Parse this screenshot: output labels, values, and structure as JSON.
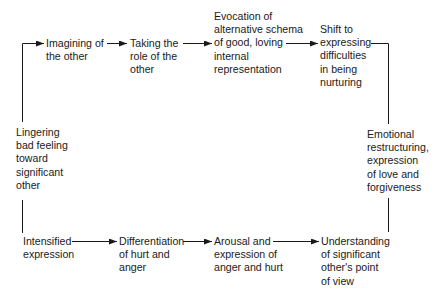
{
  "diagram": {
    "type": "cycle-flow",
    "nodes": [
      {
        "id": "lingering",
        "label": "Lingering\nbad feeling\ntoward\nsignificant\nother"
      },
      {
        "id": "imagining",
        "label": "Imagining of\nthe other"
      },
      {
        "id": "taking-role",
        "label": "Taking the\nrole of the\nother"
      },
      {
        "id": "evocation",
        "label": "Evocation of\nalternative schema\nof good, loving\ninternal\nrepresentation"
      },
      {
        "id": "shift",
        "label": "Shift to\nexpressing\ndifficulties\nin being\nnurturing"
      },
      {
        "id": "emotional",
        "label": "Emotional\nrestructuring,\nexpression\nof love and\nforgiveness"
      },
      {
        "id": "intensified",
        "label": "Intensified\nexpression"
      },
      {
        "id": "differentiation",
        "label": "Differentiation\nof hurt and\nanger"
      },
      {
        "id": "arousal",
        "label": "Arousal and\nexpression of\nanger and hurt"
      },
      {
        "id": "understanding",
        "label": "Understanding\nof significant\nother's point\nof view"
      }
    ],
    "edges": [
      {
        "from": "lingering",
        "to": "imagining"
      },
      {
        "from": "imagining",
        "to": "taking-role"
      },
      {
        "from": "taking-role",
        "to": "evocation"
      },
      {
        "from": "evocation",
        "to": "shift"
      },
      {
        "from": "shift",
        "to": "emotional"
      },
      {
        "from": "lingering",
        "to": "intensified"
      },
      {
        "from": "intensified",
        "to": "differentiation"
      },
      {
        "from": "differentiation",
        "to": "arousal"
      },
      {
        "from": "arousal",
        "to": "understanding"
      },
      {
        "from": "understanding",
        "to": "emotional"
      }
    ],
    "colors": {
      "line": "#1a1a1a",
      "text": "#1a1a1a",
      "background": "#ffffff"
    }
  }
}
